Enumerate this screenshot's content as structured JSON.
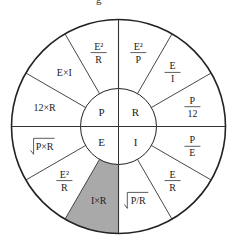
{
  "title_fragment": "g",
  "wheel": {
    "center": [
      118.5,
      126.5
    ],
    "outer_radius": 107,
    "inner_radius": 38,
    "line_color": "#222222",
    "shade_color": "#a9a9a9",
    "core": {
      "top_left": "P",
      "top_right": "R",
      "bottom_left": "E",
      "bottom_right": "I"
    },
    "segments": [
      {
        "type": "frac",
        "num": "E²",
        "den": "P"
      },
      {
        "type": "frac",
        "num": "E",
        "den": "I"
      },
      {
        "type": "frac",
        "num": "P",
        "den": "12"
      },
      {
        "type": "frac",
        "num": "P",
        "den": "E"
      },
      {
        "type": "frac",
        "num": "E",
        "den": "R"
      },
      {
        "type": "sqrt",
        "text": "P/R"
      },
      {
        "type": "text",
        "text": "I×R",
        "shaded": true
      },
      {
        "type": "frac",
        "num": "E²",
        "den": "R"
      },
      {
        "type": "sqrt",
        "text": "P×R"
      },
      {
        "type": "text",
        "text": "12×R"
      },
      {
        "type": "text",
        "text": "E×I"
      },
      {
        "type": "frac",
        "num": "E²",
        "den": "R"
      }
    ]
  }
}
